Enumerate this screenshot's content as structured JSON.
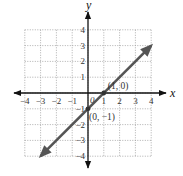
{
  "chart_data": {
    "type": "line",
    "title": "",
    "xlabel": "x",
    "ylabel": "y",
    "xlim": [
      -4,
      4
    ],
    "ylim": [
      -4,
      4
    ],
    "grid": true,
    "x_ticks": [
      "-4",
      "-3",
      "-2",
      "-1",
      "1",
      "2",
      "3",
      "4"
    ],
    "y_ticks": [
      "4",
      "3",
      "2",
      "1",
      "-1",
      "-2",
      "-3",
      "-4"
    ],
    "origin_label": "0",
    "series": [
      {
        "name": "y = x - 1",
        "x": [
          -3,
          4
        ],
        "y": [
          -4,
          3
        ],
        "arrows": "both",
        "color": "#555555"
      }
    ],
    "points": [
      {
        "x": 1,
        "y": 0,
        "label": "(1, 0)"
      },
      {
        "x": 0,
        "y": -1,
        "label": "(0, −1)"
      }
    ]
  },
  "colors": {
    "axis": "#111111",
    "grid": "#9a9a9a",
    "line": "#555555",
    "label": "#333333"
  }
}
